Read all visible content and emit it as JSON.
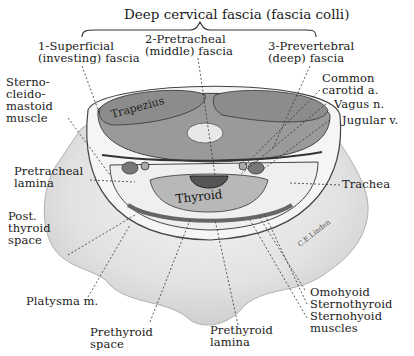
{
  "title": "Deep cervical fascia (fascia colli)",
  "fascia_labels": [
    {
      "id": "superficial",
      "text": "1-Superficial\n(investing) fascia"
    },
    {
      "id": "pretracheal",
      "text": "2-Pretracheal\n(middle) fascia"
    },
    {
      "id": "prevertebral",
      "text": "3-Prevertebral\n(deep) fascia"
    }
  ],
  "left_labels": [
    {
      "id": "sternocleidomastoid",
      "text": "Sterno-\ncleido-\nmastoid\nmuscle"
    },
    {
      "id": "pretracheal-lamina",
      "text": "Pretracheal\nlamina"
    },
    {
      "id": "post-thyroid-space",
      "text": "Post.\nthyroid\nspace"
    },
    {
      "id": "platysma",
      "text": "Platysma m."
    }
  ],
  "right_labels": [
    {
      "id": "common-carotid",
      "text": "Common\ncarotid a."
    },
    {
      "id": "vagus",
      "text": "Vagus n."
    },
    {
      "id": "jugular",
      "text": "Jugular v."
    },
    {
      "id": "trachea",
      "text": "Trachea"
    }
  ],
  "bottom_labels": [
    {
      "id": "prethyroid-space",
      "text": "Prethyroid\nspace"
    },
    {
      "id": "prethyroid-lamina",
      "text": "Prethyroid\nlamina"
    },
    {
      "id": "strap-muscles",
      "text": "Omohyoid\nSternothyroid\nSternohyoid\nmuscles"
    }
  ],
  "inner_labels": {
    "trapezius": "Trapezius",
    "thyroid": "Thyroid"
  },
  "signature": "C.E.Linden",
  "colors": {
    "background": "#ffffff",
    "neck_shading": "#d9d9d9",
    "muscle": "#8a8a8a",
    "fascia_ring": "#f2f2f2",
    "line": "#333333"
  }
}
